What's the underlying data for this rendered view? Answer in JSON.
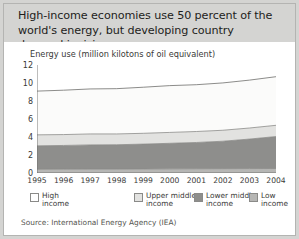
{
  "headline": "High-income economies use 50 percent of the world's energy, but developing country demand is rising",
  "source": "Source: International Energy Agency (IEA)",
  "legend": [
    {
      "label": "High\nincome",
      "color": "#ffffff"
    },
    {
      "label": "Upper middle\nincome",
      "color": "#e2e2e0"
    },
    {
      "label": "Lower middle\nincome",
      "color": "#8e8e8c"
    },
    {
      "label": "Low\nincome",
      "color": "#b6b6b4"
    }
  ],
  "chart_data": {
    "type": "area",
    "stacked": true,
    "title": "",
    "subtitle": "Energy use (million kilotons of oil equivalent)",
    "xlabel": "",
    "ylabel": "Energy use (million kilotons of oil equivalent)",
    "x": [
      1995,
      1996,
      1997,
      1998,
      1999,
      2000,
      2001,
      2002,
      2003,
      2004
    ],
    "xtick_labels": [
      "1995",
      "1996",
      "1997",
      "1998",
      "1999",
      "2000",
      "2001",
      "2002",
      "2003",
      "2004"
    ],
    "ytick_labels": [
      "0",
      "2",
      "4",
      "6",
      "8",
      "10",
      "12"
    ],
    "yticks": [
      0,
      2,
      4,
      6,
      8,
      10,
      12
    ],
    "ylim": [
      0,
      12
    ],
    "xlim": [
      1995,
      2004
    ],
    "grid": false,
    "legend_position": "bottom",
    "series": [
      {
        "name": "Low income",
        "color": "#b6b6b4",
        "values": [
          0.42,
          0.43,
          0.44,
          0.44,
          0.45,
          0.46,
          0.47,
          0.48,
          0.49,
          0.5
        ]
      },
      {
        "name": "Lower middle income",
        "color": "#8e8e8c",
        "values": [
          2.6,
          2.63,
          2.68,
          2.7,
          2.76,
          2.84,
          2.92,
          3.05,
          3.28,
          3.55
        ]
      },
      {
        "name": "Upper middle income",
        "color": "#e2e2e0",
        "values": [
          1.22,
          1.21,
          1.22,
          1.2,
          1.2,
          1.21,
          1.22,
          1.22,
          1.23,
          1.25
        ]
      },
      {
        "name": "High income",
        "color": "#fbfbfa",
        "values": [
          4.86,
          4.93,
          5.0,
          5.03,
          5.12,
          5.2,
          5.2,
          5.26,
          5.32,
          5.4
        ]
      }
    ],
    "totals": [
      9.1,
      9.2,
      9.34,
      9.37,
      9.53,
      9.71,
      9.81,
      10.01,
      10.32,
      10.7
    ]
  }
}
